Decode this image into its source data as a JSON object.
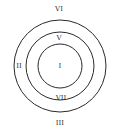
{
  "diagram": {
    "type": "concentric-circles",
    "stroke_color": "#2a2a2a",
    "background": "#ffffff",
    "circles": [
      {
        "name": "outer",
        "cx": 60,
        "cy": 66,
        "r": 46
      },
      {
        "name": "middle",
        "cx": 60,
        "cy": 66,
        "r": 34
      },
      {
        "name": "inner",
        "cx": 60,
        "cy": 66,
        "r": 22
      }
    ],
    "labels": [
      {
        "text": "VI",
        "x": 59,
        "y": 9
      },
      {
        "text": "V",
        "x": 59,
        "y": 38
      },
      {
        "text": "I",
        "x": 60,
        "y": 66
      },
      {
        "text": "II",
        "x": 19,
        "y": 66
      },
      {
        "text": "VII",
        "x": 61,
        "y": 98
      },
      {
        "text": "III",
        "x": 60,
        "y": 123
      }
    ]
  }
}
